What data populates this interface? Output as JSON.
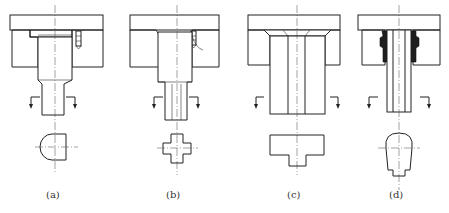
{
  "figure": {
    "panels": [
      {
        "id": "a",
        "label": "(a)",
        "section_shape": "D-shaped (half-round)",
        "feature": "stepped shoulder retained with screw"
      },
      {
        "id": "b",
        "label": "(b)",
        "section_shape": "cross-shaped",
        "feature": "stepped punch with screw"
      },
      {
        "id": "c",
        "label": "(c)",
        "section_shape": "inverted T-shaped",
        "feature": "straight punch with riveted/countersunk head"
      },
      {
        "id": "d",
        "label": "(d)",
        "section_shape": "bullet/rounded-top with notch",
        "feature": "punch fixed with poured resin/low-melt alloy"
      }
    ]
  },
  "colors": {
    "line": "#222222",
    "hatch": "#555555",
    "seal_fill": "#1e1e1e",
    "background": "#ffffff"
  }
}
